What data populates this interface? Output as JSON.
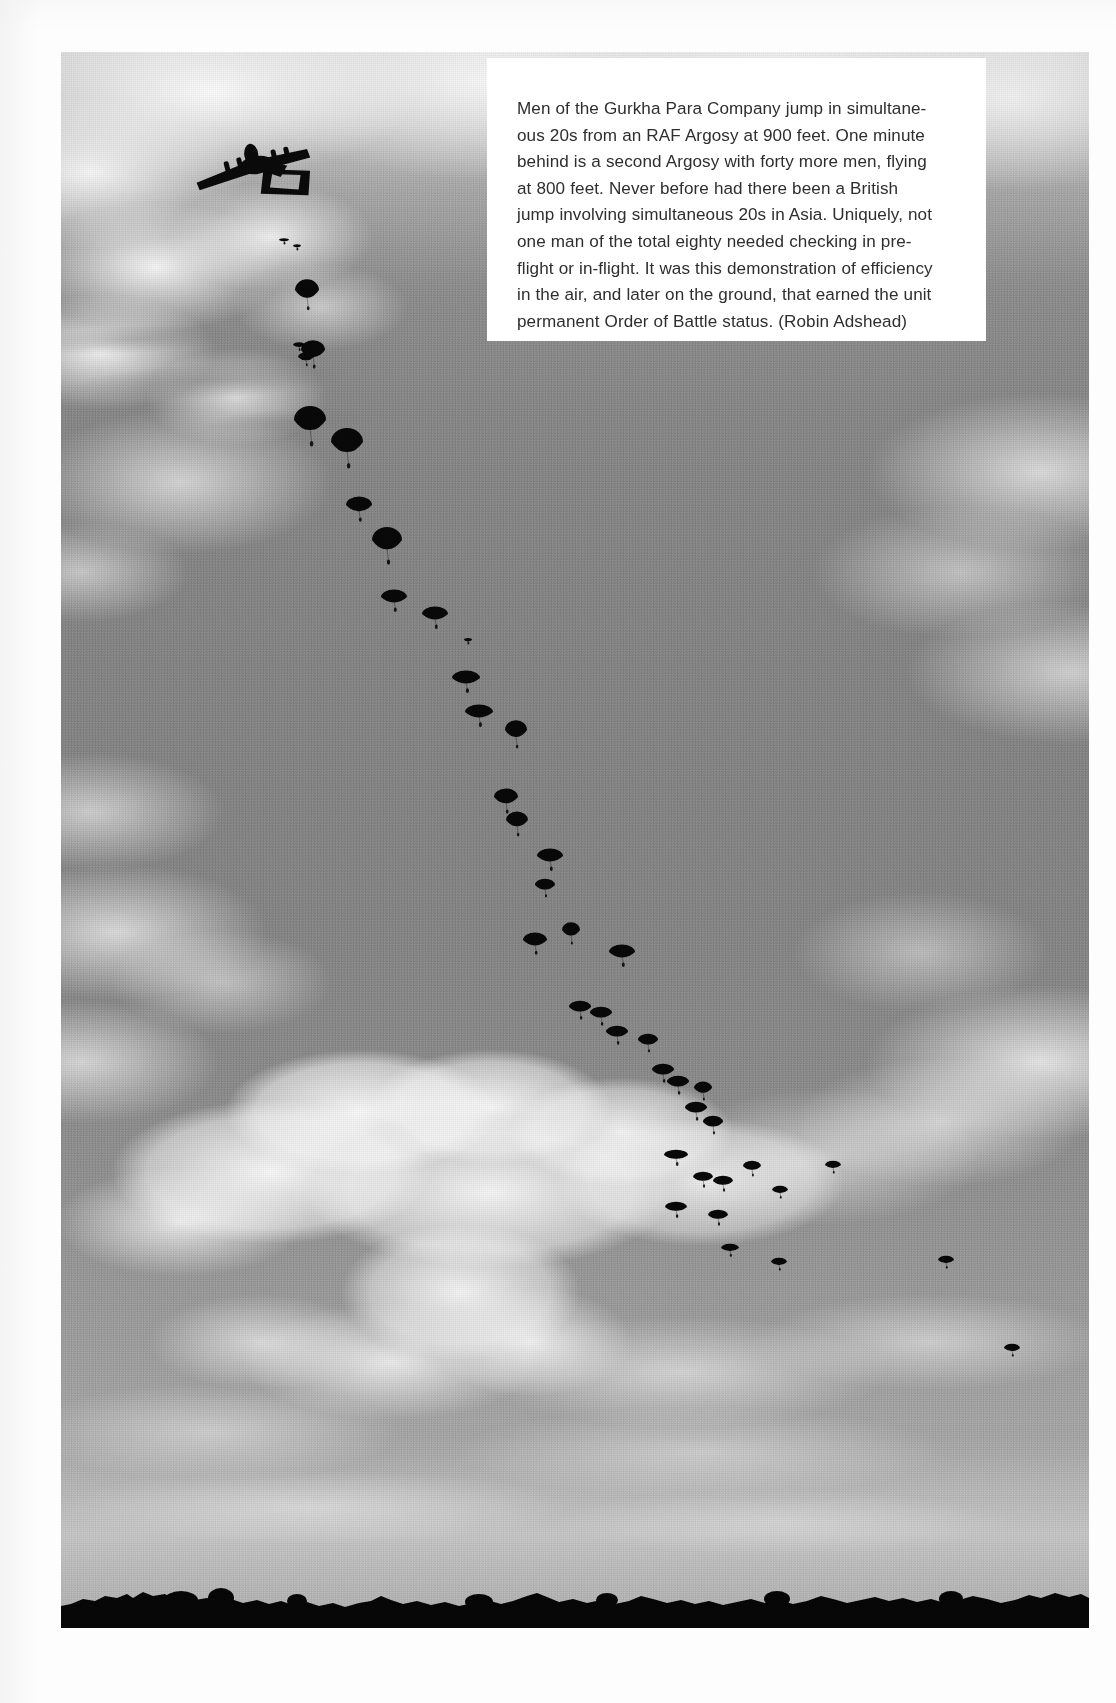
{
  "page": {
    "kind": "book-page",
    "background_color": "#fdfdfd"
  },
  "photo": {
    "name": "gurkha-para-company-mass-parachute-drop",
    "frame": {
      "x": 61,
      "y": 52,
      "width": 1028,
      "height": 1576
    },
    "scene_description": "Black and white aerial photograph of a mass parachute drop: a four-engine RAF Argosy transport aircraft at upper left with a long descending stick of parachutists trailing diagonally down to the right, cumulus clouds, and a dark treeline horizon at the bottom.",
    "colors": {
      "sky_top": "#d9d9d9",
      "sky_mid": "#878787",
      "sky_near_horizon": "#ababab",
      "cloud_white": "#f2f2f2",
      "silhouette_black": "#0b0b0b"
    },
    "aircraft": {
      "label": "RAF Argosy transport aircraft silhouette",
      "engines": 4,
      "tail": "twin-boom"
    },
    "ground": {
      "label": "treeline horizon silhouette",
      "color": "#070707"
    }
  },
  "caption": {
    "box": {
      "x": 487,
      "y": 58,
      "width": 499,
      "height": 283,
      "background": "#ffffff"
    },
    "text_color": "#2e2e30",
    "lines": [
      "Men of the Gurkha Para Company jump in simultane-",
      "ous 20s from an RAF Argosy at 900 feet. One minute",
      "behind is a second Argosy with forty more men, flying",
      "at 800 feet. Never before had there been a British",
      "jump involving simultaneous 20s in Asia. Uniquely, not",
      "one man of the total eighty needed checking in pre-",
      "flight or in-flight. It was this demonstration of efficiency",
      "in the air, and later on the ground, that earned the unit",
      "permanent Order of Battle status. (Robin Adshead)"
    ],
    "full_text": "Men of the Gurkha Para Company jump in simultaneous 20s from an RAF Argosy at 900 feet. One minute behind is a second Argosy with forty more men, flying at 800 feet. Never before had there been a British jump involving simultaneous 20s in Asia. Uniquely, not one man of the total eighty needed checking in pre-flight or in-flight. It was this demonstration of efficiency in the air, and later on the ground, that earned the unit permanent Order of Battle status. (Robin Adshead)",
    "credit": "(Robin Adshead)"
  },
  "chutes": {
    "label": "stick of descending parachutists",
    "count": 44,
    "items": [
      {
        "x": 284,
        "y": 240,
        "rx": 5,
        "ry": 3,
        "open": 0.15
      },
      {
        "x": 297,
        "y": 246,
        "rx": 4,
        "ry": 3,
        "open": 0.15
      },
      {
        "x": 307,
        "y": 290,
        "rx": 12,
        "ry": 11,
        "open": 0.95
      },
      {
        "x": 299,
        "y": 345,
        "rx": 6,
        "ry": 4,
        "open": 0.3
      },
      {
        "x": 313,
        "y": 350,
        "rx": 12,
        "ry": 10,
        "open": 0.95
      },
      {
        "x": 306,
        "y": 357,
        "rx": 8,
        "ry": 6,
        "open": 0.5
      },
      {
        "x": 310,
        "y": 420,
        "rx": 16,
        "ry": 14,
        "open": 1.0
      },
      {
        "x": 347,
        "y": 442,
        "rx": 16,
        "ry": 14,
        "open": 1.0
      },
      {
        "x": 359,
        "y": 505,
        "rx": 13,
        "ry": 9,
        "open": 0.9
      },
      {
        "x": 387,
        "y": 540,
        "rx": 15,
        "ry": 13,
        "open": 1.0
      },
      {
        "x": 394,
        "y": 597,
        "rx": 13,
        "ry": 8,
        "open": 0.85
      },
      {
        "x": 435,
        "y": 614,
        "rx": 13,
        "ry": 8,
        "open": 0.85
      },
      {
        "x": 466,
        "y": 678,
        "rx": 14,
        "ry": 8,
        "open": 0.85
      },
      {
        "x": 479,
        "y": 712,
        "rx": 14,
        "ry": 8,
        "open": 0.85
      },
      {
        "x": 516,
        "y": 730,
        "rx": 11,
        "ry": 10,
        "open": 0.95
      },
      {
        "x": 506,
        "y": 797,
        "rx": 12,
        "ry": 9,
        "open": 0.9
      },
      {
        "x": 517,
        "y": 820,
        "rx": 11,
        "ry": 9,
        "open": 0.9
      },
      {
        "x": 550,
        "y": 856,
        "rx": 13,
        "ry": 8,
        "open": 0.85
      },
      {
        "x": 545,
        "y": 885,
        "rx": 10,
        "ry": 7,
        "open": 0.8
      },
      {
        "x": 535,
        "y": 940,
        "rx": 12,
        "ry": 8,
        "open": 0.85
      },
      {
        "x": 571,
        "y": 930,
        "rx": 9,
        "ry": 8,
        "open": 0.9
      },
      {
        "x": 622,
        "y": 952,
        "rx": 13,
        "ry": 8,
        "open": 0.85
      },
      {
        "x": 580,
        "y": 1007,
        "rx": 11,
        "ry": 7,
        "open": 0.8
      },
      {
        "x": 601,
        "y": 1013,
        "rx": 11,
        "ry": 7,
        "open": 0.8
      },
      {
        "x": 617,
        "y": 1032,
        "rx": 11,
        "ry": 7,
        "open": 0.8
      },
      {
        "x": 648,
        "y": 1040,
        "rx": 10,
        "ry": 7,
        "open": 0.8
      },
      {
        "x": 663,
        "y": 1070,
        "rx": 11,
        "ry": 7,
        "open": 0.8
      },
      {
        "x": 678,
        "y": 1082,
        "rx": 11,
        "ry": 7,
        "open": 0.8
      },
      {
        "x": 703,
        "y": 1088,
        "rx": 9,
        "ry": 7,
        "open": 0.85
      },
      {
        "x": 696,
        "y": 1108,
        "rx": 11,
        "ry": 7,
        "open": 0.8
      },
      {
        "x": 713,
        "y": 1122,
        "rx": 10,
        "ry": 7,
        "open": 0.8
      },
      {
        "x": 676,
        "y": 1155,
        "rx": 12,
        "ry": 6,
        "open": 0.75
      },
      {
        "x": 703,
        "y": 1177,
        "rx": 10,
        "ry": 6,
        "open": 0.75
      },
      {
        "x": 723,
        "y": 1181,
        "rx": 10,
        "ry": 6,
        "open": 0.75
      },
      {
        "x": 752,
        "y": 1166,
        "rx": 9,
        "ry": 6,
        "open": 0.75
      },
      {
        "x": 676,
        "y": 1207,
        "rx": 11,
        "ry": 6,
        "open": 0.75
      },
      {
        "x": 718,
        "y": 1215,
        "rx": 10,
        "ry": 6,
        "open": 0.75
      },
      {
        "x": 780,
        "y": 1190,
        "rx": 8,
        "ry": 5,
        "open": 0.7
      },
      {
        "x": 833,
        "y": 1165,
        "rx": 8,
        "ry": 5,
        "open": 0.7
      },
      {
        "x": 730,
        "y": 1248,
        "rx": 9,
        "ry": 5,
        "open": 0.7
      },
      {
        "x": 779,
        "y": 1262,
        "rx": 8,
        "ry": 5,
        "open": 0.7
      },
      {
        "x": 946,
        "y": 1260,
        "rx": 8,
        "ry": 5,
        "open": 0.7
      },
      {
        "x": 1012,
        "y": 1348,
        "rx": 8,
        "ry": 5,
        "open": 0.7
      },
      {
        "x": 468,
        "y": 640,
        "rx": 4,
        "ry": 3,
        "open": 0.2
      }
    ]
  }
}
